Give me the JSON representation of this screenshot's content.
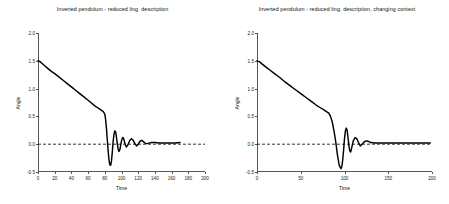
{
  "figure": {
    "background": "#ffffff",
    "line_color": "#000000",
    "axis_color": "#555555",
    "zero_line_color": "#000000"
  },
  "panels": [
    {
      "id": "left",
      "title": "Inverted pendulum - reduced ling. description",
      "xlabel": "Time",
      "ylabel": "Angle",
      "xticks": [
        0,
        20,
        40,
        60,
        80,
        100,
        120,
        140,
        160,
        180,
        200
      ],
      "xtick_labels": [
        "0",
        "20",
        "40",
        "60",
        "80",
        "100",
        "120",
        "140",
        "160",
        "180",
        "200"
      ],
      "yticks": [
        -0.5,
        0.0,
        0.5,
        1.0,
        1.5,
        2.0
      ],
      "ytick_labels": [
        "-0.5",
        "0.0",
        "0.5",
        "1.0",
        "1.5",
        "2.0"
      ],
      "xlim": [
        0,
        200
      ],
      "ylim": [
        -0.5,
        2.0
      ],
      "zero_line": 0.0
    },
    {
      "id": "right",
      "title": "Inverted pendulum - reduced ling. description, changing context",
      "xlabel": "Time",
      "ylabel": "Angle",
      "xticks": [
        0,
        50,
        100,
        150,
        200
      ],
      "xtick_labels": [
        "0",
        "50",
        "100",
        "150",
        "200"
      ],
      "yticks": [
        -0.5,
        0.0,
        0.5,
        1.0,
        1.5,
        2.0
      ],
      "ytick_labels": [
        "-0.5",
        "0.0",
        "0.5",
        "1.0",
        "1.5",
        "2.0"
      ],
      "xlim": [
        0,
        200
      ],
      "ylim": [
        -0.5,
        2.0
      ],
      "zero_line": 0.0
    }
  ],
  "chart_data": [
    {
      "type": "line",
      "title": "Inverted pendulum - reduced ling. description",
      "xlabel": "Time",
      "ylabel": "Angle",
      "xlim": [
        0,
        200
      ],
      "ylim": [
        -0.5,
        2.0
      ],
      "grid": false,
      "legend": "none",
      "annotations": [
        {
          "type": "hline",
          "y": 0.0,
          "style": "dashed",
          "label": "zero reference"
        }
      ],
      "series": [
        {
          "name": "Angle",
          "x": [
            0,
            2,
            5,
            8,
            12,
            16,
            20,
            25,
            30,
            35,
            40,
            45,
            50,
            55,
            60,
            64,
            68,
            71,
            74,
            76,
            78,
            80,
            81,
            82,
            83,
            84,
            85,
            86,
            87,
            88,
            89,
            90,
            91,
            92,
            93,
            94,
            95,
            96,
            97,
            98,
            99,
            100,
            101,
            102,
            103,
            104,
            105,
            106,
            108,
            110,
            112,
            114,
            116,
            118,
            120,
            122,
            124,
            126,
            128,
            130,
            133,
            136,
            140,
            145,
            150,
            155,
            160,
            165,
            170
          ],
          "y": [
            1.5,
            1.49,
            1.45,
            1.41,
            1.36,
            1.31,
            1.27,
            1.21,
            1.15,
            1.09,
            1.03,
            0.97,
            0.91,
            0.85,
            0.79,
            0.74,
            0.69,
            0.66,
            0.63,
            0.61,
            0.59,
            0.54,
            0.44,
            0.28,
            0.08,
            -0.12,
            -0.28,
            -0.37,
            -0.38,
            -0.3,
            -0.14,
            0.05,
            0.18,
            0.24,
            0.22,
            0.12,
            0.0,
            -0.09,
            -0.13,
            -0.1,
            -0.02,
            0.06,
            0.11,
            0.12,
            0.08,
            0.02,
            -0.03,
            -0.05,
            0.0,
            0.07,
            0.1,
            0.07,
            0.01,
            -0.03,
            0.0,
            0.05,
            0.07,
            0.05,
            0.02,
            0.01,
            0.02,
            0.03,
            0.03,
            0.02,
            0.02,
            0.02,
            0.02,
            0.02,
            0.03
          ]
        }
      ]
    },
    {
      "type": "line",
      "title": "Inverted pendulum - reduced ling. description, changing context",
      "xlabel": "Time",
      "ylabel": "Angle",
      "xlim": [
        0,
        200
      ],
      "ylim": [
        -0.5,
        2.0
      ],
      "grid": false,
      "legend": "none",
      "annotations": [
        {
          "type": "hline",
          "y": 0.0,
          "style": "dashed",
          "label": "zero reference"
        }
      ],
      "series": [
        {
          "name": "Angle",
          "x": [
            0,
            3,
            6,
            10,
            15,
            20,
            26,
            32,
            38,
            44,
            50,
            56,
            62,
            68,
            72,
            76,
            79,
            82,
            84,
            86,
            88,
            90,
            92,
            94,
            96,
            97,
            98,
            99,
            100,
            101,
            102,
            103,
            104,
            105,
            106,
            107,
            108,
            110,
            112,
            114,
            116,
            118,
            120,
            123,
            126,
            130,
            135,
            140,
            145,
            150,
            160,
            170,
            180,
            190,
            198
          ],
          "y": [
            1.5,
            1.48,
            1.44,
            1.39,
            1.33,
            1.27,
            1.2,
            1.12,
            1.05,
            0.98,
            0.91,
            0.84,
            0.77,
            0.7,
            0.66,
            0.62,
            0.59,
            0.56,
            0.5,
            0.4,
            0.24,
            0.04,
            -0.2,
            -0.38,
            -0.44,
            -0.4,
            -0.28,
            -0.1,
            0.1,
            0.24,
            0.29,
            0.25,
            0.12,
            -0.02,
            -0.12,
            -0.14,
            -0.08,
            0.06,
            0.12,
            0.1,
            0.03,
            -0.03,
            0.0,
            0.05,
            0.06,
            0.03,
            0.02,
            0.02,
            0.02,
            0.02,
            0.02,
            0.02,
            0.02,
            0.02,
            0.02
          ]
        }
      ]
    }
  ]
}
